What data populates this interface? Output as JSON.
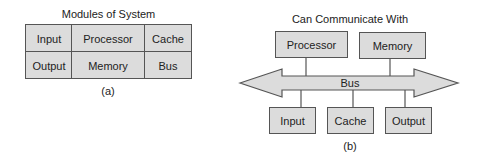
{
  "figure_a": {
    "title": "Modules of System",
    "caption": "(a)",
    "rows": [
      [
        "Input",
        "Processor",
        "Cache"
      ],
      [
        "Output",
        "Memory",
        "Bus"
      ]
    ]
  },
  "figure_b": {
    "title": "Can Communicate With",
    "caption": "(b)",
    "bus_label": "Bus",
    "top_modules": [
      "Processor",
      "Memory"
    ],
    "bottom_modules": [
      "Input",
      "Cache",
      "Output"
    ]
  },
  "colors": {
    "fill": "#dcdcdc",
    "stroke": "#555555"
  }
}
